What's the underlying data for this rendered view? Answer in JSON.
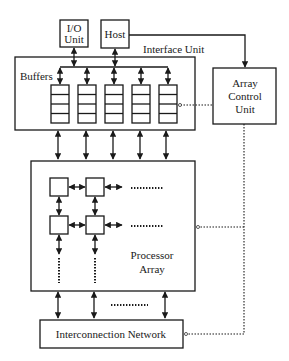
{
  "diagram": {
    "nodes": {
      "io_unit": {
        "line1": "I/O",
        "line2": "Unit"
      },
      "host": {
        "label": "Host"
      },
      "interface_unit": {
        "label": "Interface Unit"
      },
      "buffers": {
        "label": "Buffers",
        "count": 5,
        "cells_per_buffer": 4
      },
      "array_control_unit": {
        "line1": "Array",
        "line2": "Control",
        "line3": "Unit"
      },
      "processor_array": {
        "line1": "Processor",
        "line2": "Array"
      },
      "interconnection_network": {
        "label": "Interconnection Network"
      }
    },
    "edges": [
      {
        "from": "io_unit",
        "to": "buffers",
        "style": "solid",
        "direction": "bidirectional"
      },
      {
        "from": "host",
        "to": "buffers",
        "style": "solid",
        "direction": "bidirectional"
      },
      {
        "from": "host",
        "to": "array_control_unit",
        "style": "solid",
        "direction": "forward"
      },
      {
        "from": "array_control_unit",
        "to": "buffers",
        "style": "dotted",
        "direction": "control"
      },
      {
        "from": "array_control_unit",
        "to": "processor_array",
        "style": "dotted",
        "direction": "control"
      },
      {
        "from": "array_control_unit",
        "to": "interconnection_network",
        "style": "dotted",
        "direction": "control"
      },
      {
        "from": "buffers",
        "to": "processor_array",
        "style": "solid",
        "direction": "bidirectional",
        "count": 5
      },
      {
        "from": "processor_array",
        "to": "interconnection_network",
        "style": "solid",
        "direction": "bidirectional",
        "count": 3
      }
    ],
    "colors": {
      "stroke": "#1a1a1a",
      "background": "#ffffff"
    }
  }
}
